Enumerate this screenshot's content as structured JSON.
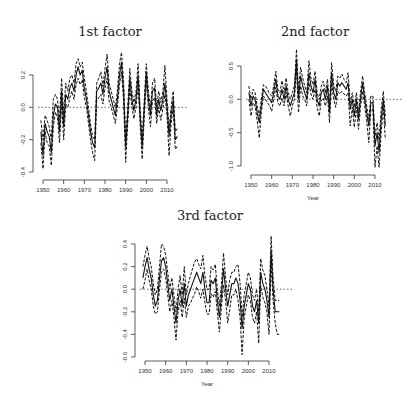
{
  "chart_data": [
    {
      "type": "line",
      "title": "1st factor",
      "xlabel": "Year",
      "ylabel": "",
      "ylim": [
        -0.4,
        0.3
      ],
      "xlim": [
        1948,
        2016
      ],
      "xticks": [
        1950,
        1960,
        1970,
        1980,
        1990,
        2000,
        2010
      ],
      "yticks": [
        -0.4,
        -0.2,
        0.0,
        0.2
      ],
      "ytick_labels": [
        "-0.4",
        "-0.2",
        "0.0",
        "0.2"
      ],
      "reference_line": 0.0,
      "x": [
        1949,
        1950,
        1951,
        1952,
        1953,
        1954,
        1955,
        1956,
        1957,
        1958,
        1959,
        1960,
        1961,
        1962,
        1963,
        1964,
        1965,
        1966,
        1967,
        1968,
        1969,
        1970,
        1971,
        1972,
        1973,
        1974,
        1975,
        1976,
        1977,
        1978,
        1979,
        1980,
        1981,
        1982,
        1983,
        1984,
        1985,
        1986,
        1987,
        1988,
        1989,
        1990,
        1991,
        1992,
        1993,
        1994,
        1995,
        1996,
        1997,
        1998,
        1999,
        2000,
        2001,
        2002,
        2003,
        2004,
        2005,
        2006,
        2007,
        2008,
        2009,
        2010,
        2011,
        2012,
        2013,
        2014,
        2015
      ],
      "series": [
        {
          "name": "estimate",
          "style": "solid",
          "values": [
            -0.15,
            -0.3,
            -0.1,
            -0.15,
            -0.18,
            -0.28,
            -0.05,
            0.02,
            0.0,
            -0.15,
            0.1,
            -0.12,
            0.08,
            0.05,
            0.12,
            0.15,
            0.1,
            0.2,
            0.25,
            0.2,
            0.23,
            0.12,
            0.05,
            -0.05,
            -0.15,
            -0.22,
            -0.25,
            0.1,
            0.12,
            0.15,
            0.08,
            0.18,
            0.25,
            0.1,
            0.05,
            0.0,
            -0.05,
            0.05,
            0.2,
            0.28,
            0.1,
            -0.25,
            -0.05,
            0.18,
            0.05,
            -0.02,
            0.05,
            0.2,
            -0.05,
            -0.25,
            0.0,
            0.22,
            0.05,
            -0.05,
            0.1,
            0.12,
            -0.05,
            0.05,
            -0.02,
            0.05,
            0.15,
            0.0,
            -0.18,
            -0.05,
            0.05,
            -0.2,
            -0.18
          ]
        },
        {
          "name": "upper",
          "style": "dashed",
          "values": [
            -0.08,
            -0.2,
            -0.05,
            -0.08,
            -0.12,
            -0.2,
            0.05,
            0.08,
            0.05,
            -0.08,
            0.18,
            -0.05,
            0.15,
            0.1,
            0.18,
            0.2,
            0.15,
            0.27,
            0.3,
            0.25,
            0.28,
            0.18,
            0.1,
            0.0,
            -0.1,
            -0.18,
            -0.2,
            0.15,
            0.18,
            0.22,
            0.13,
            0.24,
            0.33,
            0.15,
            0.1,
            0.05,
            0.0,
            0.1,
            0.27,
            0.34,
            0.16,
            -0.2,
            0.0,
            0.24,
            0.1,
            0.03,
            0.1,
            0.27,
            0.0,
            -0.2,
            0.05,
            0.27,
            0.1,
            0.0,
            0.15,
            0.18,
            0.0,
            0.1,
            0.03,
            0.1,
            0.26,
            0.05,
            -0.13,
            0.0,
            0.1,
            -0.15,
            -0.13
          ]
        },
        {
          "name": "lower",
          "style": "dashed",
          "values": [
            -0.22,
            -0.38,
            -0.15,
            -0.22,
            -0.24,
            -0.36,
            -0.12,
            -0.03,
            -0.06,
            -0.22,
            0.02,
            -0.2,
            0.02,
            0.0,
            0.06,
            0.1,
            0.05,
            0.14,
            0.18,
            0.14,
            0.17,
            0.06,
            0.0,
            -0.1,
            -0.2,
            -0.28,
            -0.33,
            0.04,
            0.06,
            0.08,
            0.02,
            0.12,
            0.18,
            0.04,
            0.0,
            -0.05,
            -0.1,
            0.0,
            0.14,
            0.22,
            0.04,
            -0.34,
            -0.1,
            0.12,
            0.0,
            -0.07,
            0.0,
            0.14,
            -0.1,
            -0.32,
            -0.06,
            0.16,
            0.0,
            -0.12,
            0.04,
            0.06,
            -0.1,
            0.0,
            -0.08,
            -0.01,
            0.08,
            -0.05,
            -0.3,
            -0.1,
            0.0,
            -0.26,
            -0.24
          ]
        }
      ]
    },
    {
      "type": "line",
      "title": "2nd factor",
      "xlabel": "Year",
      "ylabel": "",
      "ylim": [
        -1.05,
        0.75
      ],
      "xlim": [
        1948,
        2016
      ],
      "xticks": [
        1950,
        1960,
        1970,
        1980,
        1990,
        2000,
        2010
      ],
      "yticks": [
        -1.0,
        -0.5,
        0.0,
        0.5
      ],
      "ytick_labels": [
        "-1.0",
        "-0.5",
        "0.0",
        "0.5"
      ],
      "reference_line": 0.0,
      "x": [
        1949,
        1950,
        1951,
        1952,
        1953,
        1954,
        1955,
        1956,
        1957,
        1958,
        1959,
        1960,
        1961,
        1962,
        1963,
        1964,
        1965,
        1966,
        1967,
        1968,
        1969,
        1970,
        1971,
        1972,
        1973,
        1974,
        1975,
        1976,
        1977,
        1978,
        1979,
        1980,
        1981,
        1982,
        1983,
        1984,
        1985,
        1986,
        1987,
        1988,
        1989,
        1990,
        1991,
        1992,
        1993,
        1994,
        1995,
        1996,
        1997,
        1998,
        1999,
        2000,
        2001,
        2002,
        2003,
        2004,
        2005,
        2006,
        2007,
        2008,
        2009,
        2010,
        2011,
        2012,
        2013,
        2014,
        2015
      ],
      "series": [
        {
          "name": "estimate",
          "style": "solid",
          "values": [
            0.1,
            -0.1,
            0.05,
            0.0,
            -0.2,
            -0.35,
            -0.1,
            0.15,
            0.1,
            0.05,
            0.0,
            -0.05,
            0.1,
            0.3,
            0.05,
            0.0,
            0.15,
            0.0,
            0.2,
            0.0,
            -0.1,
            0.0,
            0.1,
            0.6,
            0.0,
            0.35,
            0.2,
            0.1,
            0.0,
            0.4,
            0.2,
            0.1,
            0.3,
            0.0,
            -0.1,
            0.1,
            0.15,
            0.0,
            0.2,
            -0.2,
            0.4,
            0.1,
            0.0,
            0.25,
            0.2,
            0.25,
            0.2,
            0.15,
            0.25,
            -0.15,
            0.0,
            -0.25,
            0.0,
            -0.3,
            0.0,
            0.25,
            0.0,
            -0.2,
            -0.4,
            -0.05,
            -0.05,
            -0.7,
            -0.5,
            -0.8,
            -0.3,
            0.0,
            -0.4
          ]
        },
        {
          "name": "upper",
          "style": "dashed",
          "values": [
            0.2,
            0.0,
            0.15,
            0.1,
            -0.1,
            -0.25,
            0.0,
            0.22,
            0.2,
            0.15,
            0.08,
            0.05,
            0.2,
            0.42,
            0.15,
            0.1,
            0.28,
            0.1,
            0.32,
            0.1,
            0.0,
            0.1,
            0.2,
            0.75,
            0.12,
            0.48,
            0.32,
            0.2,
            0.1,
            0.58,
            0.32,
            0.22,
            0.42,
            0.1,
            0.0,
            0.2,
            0.27,
            0.1,
            0.3,
            -0.1,
            0.55,
            0.22,
            0.12,
            0.35,
            0.32,
            0.38,
            0.3,
            0.25,
            0.4,
            -0.05,
            0.1,
            -0.12,
            0.1,
            -0.2,
            0.1,
            0.35,
            0.1,
            -0.1,
            -0.3,
            0.05,
            0.05,
            -0.55,
            -0.35,
            -0.62,
            -0.15,
            0.12,
            -0.25
          ]
        },
        {
          "name": "lower",
          "style": "dashed",
          "values": [
            0.0,
            -0.25,
            -0.05,
            -0.1,
            -0.32,
            -0.58,
            -0.2,
            0.05,
            0.0,
            -0.05,
            -0.1,
            -0.18,
            0.0,
            0.18,
            -0.05,
            -0.1,
            0.02,
            -0.1,
            0.1,
            -0.1,
            -0.25,
            -0.1,
            0.0,
            0.45,
            -0.2,
            0.2,
            0.05,
            0.0,
            -0.1,
            0.25,
            0.08,
            0.0,
            0.15,
            -0.12,
            -0.25,
            -0.02,
            0.02,
            -0.1,
            0.05,
            -0.35,
            0.25,
            0.0,
            -0.12,
            0.12,
            0.08,
            0.12,
            0.08,
            0.05,
            0.1,
            -0.4,
            -0.12,
            -0.42,
            -0.12,
            -0.45,
            -0.12,
            0.12,
            -0.1,
            -0.32,
            -0.65,
            -0.15,
            -0.15,
            -1.02,
            -0.7,
            -1.02,
            -0.5,
            -0.12,
            -0.6
          ]
        }
      ]
    },
    {
      "type": "line",
      "title": "3rd factor",
      "xlabel": "Year",
      "ylabel": "",
      "ylim": [
        -0.6,
        0.45
      ],
      "xlim": [
        1948,
        2016
      ],
      "xticks": [
        1950,
        1960,
        1970,
        1980,
        1990,
        2000,
        2010
      ],
      "yticks": [
        -0.6,
        -0.4,
        -0.2,
        0.0,
        0.2,
        0.4
      ],
      "ytick_labels": [
        "-0.6",
        "-0.4",
        "-0.2",
        "0.0",
        "0.2",
        "0.4"
      ],
      "reference_line": 0.0,
      "x": [
        1949,
        1950,
        1951,
        1952,
        1953,
        1954,
        1955,
        1956,
        1957,
        1958,
        1959,
        1960,
        1961,
        1962,
        1963,
        1964,
        1965,
        1966,
        1967,
        1968,
        1969,
        1970,
        1971,
        1972,
        1973,
        1974,
        1975,
        1976,
        1977,
        1978,
        1979,
        1980,
        1981,
        1982,
        1983,
        1984,
        1985,
        1986,
        1987,
        1988,
        1989,
        1990,
        1991,
        1992,
        1993,
        1994,
        1995,
        1996,
        1997,
        1998,
        1999,
        2000,
        2001,
        2002,
        2003,
        2004,
        2005,
        2006,
        2007,
        2008,
        2009,
        2010,
        2011,
        2012,
        2013,
        2014,
        2015
      ],
      "series": [
        {
          "name": "estimate",
          "style": "solid",
          "values": [
            0.1,
            0.2,
            0.28,
            0.18,
            0.1,
            -0.05,
            -0.15,
            -0.1,
            0.1,
            0.25,
            0.28,
            0.2,
            0.05,
            -0.1,
            0.0,
            -0.15,
            -0.3,
            -0.1,
            0.0,
            -0.15,
            0.05,
            -0.15,
            -0.05,
            0.0,
            0.05,
            0.1,
            0.15,
            0.1,
            0.05,
            0.15,
            0.0,
            -0.12,
            -0.12,
            0.08,
            0.05,
            0.1,
            -0.1,
            -0.25,
            -0.05,
            0.18,
            0.0,
            -0.15,
            -0.05,
            0.05,
            0.05,
            0.1,
            0.05,
            -0.1,
            -0.35,
            -0.15,
            -0.05,
            0.05,
            0.0,
            -0.15,
            -0.2,
            -0.1,
            -0.3,
            0.15,
            0.05,
            0.0,
            -0.1,
            -0.25,
            0.35,
            0.0,
            -0.2,
            -0.2,
            -0.2
          ]
        },
        {
          "name": "upper",
          "style": "dashed",
          "values": [
            0.2,
            0.3,
            0.38,
            0.28,
            0.2,
            0.05,
            -0.05,
            0.0,
            0.2,
            0.4,
            0.38,
            0.3,
            0.15,
            0.0,
            0.1,
            -0.05,
            -0.2,
            0.0,
            0.12,
            -0.05,
            0.2,
            -0.05,
            0.05,
            0.12,
            0.18,
            0.24,
            0.27,
            0.22,
            0.18,
            0.3,
            0.12,
            0.0,
            0.0,
            0.2,
            0.17,
            0.22,
            0.0,
            -0.15,
            0.05,
            0.32,
            0.1,
            -0.05,
            0.08,
            0.15,
            0.15,
            0.2,
            0.22,
            0.05,
            -0.25,
            -0.05,
            0.05,
            0.15,
            0.1,
            -0.05,
            -0.1,
            0.0,
            -0.2,
            0.27,
            0.17,
            0.12,
            0.0,
            -0.15,
            0.47,
            0.1,
            -0.1,
            -0.1,
            -0.1
          ]
        },
        {
          "name": "lower",
          "style": "dashed",
          "values": [
            0.0,
            0.08,
            0.18,
            0.08,
            0.0,
            -0.15,
            -0.22,
            -0.2,
            0.0,
            0.15,
            0.18,
            0.1,
            -0.05,
            -0.2,
            -0.1,
            -0.25,
            -0.45,
            -0.2,
            -0.1,
            -0.25,
            -0.08,
            -0.25,
            -0.15,
            -0.12,
            -0.08,
            -0.04,
            0.02,
            -0.02,
            -0.08,
            0.0,
            -0.12,
            -0.22,
            -0.22,
            -0.04,
            -0.07,
            -0.02,
            -0.2,
            -0.38,
            -0.15,
            0.04,
            -0.1,
            -0.3,
            -0.18,
            -0.05,
            -0.05,
            0.0,
            -0.1,
            -0.25,
            -0.58,
            -0.25,
            -0.15,
            -0.05,
            -0.1,
            -0.25,
            -0.3,
            -0.2,
            -0.48,
            0.03,
            -0.07,
            -0.12,
            -0.2,
            -0.4,
            0.23,
            -0.1,
            -0.3,
            -0.4,
            -0.4
          ]
        }
      ]
    }
  ],
  "panels": [
    {
      "title": "1st factor",
      "xlabel": "Year"
    },
    {
      "title": "2nd factor",
      "xlabel": "Year"
    },
    {
      "title": "3rd factor",
      "xlabel": "Year"
    }
  ]
}
